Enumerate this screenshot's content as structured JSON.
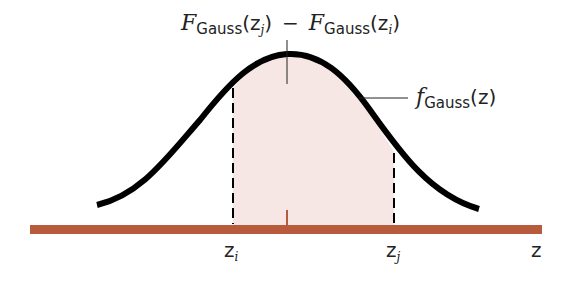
{
  "diagram": {
    "title_label": {
      "upper_F": "F",
      "upper_sub": "Gauss",
      "upper_arg": "(z",
      "upper_arg_sub": "j",
      "upper_close": ")",
      "minus": "−",
      "lower_F": "F",
      "lower_sub": "Gauss",
      "lower_arg": "(z",
      "lower_arg_sub": "i",
      "lower_close": ")"
    },
    "curve_label": {
      "f": "f",
      "sub": "Gauss",
      "arg": "(z)"
    },
    "axis_labels": {
      "zi": "z",
      "zi_sub": "i",
      "zj": "z",
      "zj_sub": "j",
      "z": "z"
    },
    "colors": {
      "axis": "#b85a3c",
      "curve": "#000000",
      "shade": "#f6e7e5",
      "dashes": "#000000"
    }
  }
}
